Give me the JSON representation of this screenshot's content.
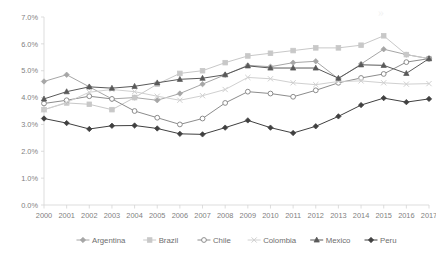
{
  "chart_data": {
    "type": "line",
    "title": "",
    "xlabel": "",
    "ylabel": "",
    "grid": false,
    "legend_position": "bottom",
    "ylim": [
      0,
      7
    ],
    "y_tick_labels": [
      "0.0%",
      "1.0%",
      "2.0%",
      "3.0%",
      "4.0%",
      "5.0%",
      "6.0%",
      "7.0%"
    ],
    "y_tick_values": [
      0,
      1,
      2,
      3,
      4,
      5,
      6,
      7
    ],
    "categories": [
      "2000",
      "2001",
      "2002",
      "2003",
      "2004",
      "2005",
      "2006",
      "2007",
      "2008",
      "2009",
      "2010",
      "2011",
      "2012",
      "2013",
      "2014",
      "2015",
      "2016",
      "2017"
    ],
    "series": [
      {
        "name": "Argentina",
        "color": "#a6a6a6",
        "marker": "diamond",
        "marker_fill": "#a6a6a6",
        "values": [
          4.6,
          4.85,
          4.4,
          3.95,
          4.0,
          3.9,
          4.15,
          4.5,
          4.85,
          5.2,
          5.15,
          5.3,
          5.35,
          4.7,
          5.25,
          5.8,
          5.6,
          5.45
        ]
      },
      {
        "name": "Brazil",
        "color": "#c8c8c8",
        "marker": "square",
        "marker_fill": "#c8c8c8",
        "values": [
          3.55,
          3.8,
          3.75,
          3.55,
          4.0,
          4.5,
          4.9,
          5.0,
          5.3,
          5.55,
          5.65,
          5.75,
          5.85,
          5.85,
          5.95,
          6.3,
          5.6,
          5.45
        ]
      },
      {
        "name": "Chile",
        "color": "#8c8c8c",
        "marker": "circle-open",
        "marker_fill": "#ffffff",
        "values": [
          3.78,
          3.9,
          4.05,
          3.95,
          3.5,
          3.25,
          3.0,
          3.22,
          3.8,
          4.22,
          4.15,
          4.03,
          4.27,
          4.55,
          4.73,
          4.88,
          5.32,
          5.45
        ]
      },
      {
        "name": "Colombia",
        "color": "#d0d0d0",
        "marker": "cross",
        "marker_fill": "#d0d0d0",
        "values": [
          3.55,
          3.82,
          4.2,
          4.3,
          4.22,
          4.05,
          3.9,
          4.07,
          4.3,
          4.75,
          4.7,
          4.55,
          4.48,
          4.6,
          4.62,
          4.55,
          4.5,
          4.52
        ]
      },
      {
        "name": "Mexico",
        "color": "#595959",
        "marker": "triangle",
        "marker_fill": "#595959",
        "values": [
          3.95,
          4.22,
          4.4,
          4.35,
          4.42,
          4.55,
          4.68,
          4.72,
          4.85,
          5.18,
          5.1,
          5.1,
          5.1,
          4.72,
          5.22,
          5.2,
          4.9,
          5.45
        ]
      },
      {
        "name": "Peru",
        "color": "#404040",
        "marker": "diamond",
        "marker_fill": "#404040",
        "values": [
          3.22,
          3.05,
          2.83,
          2.95,
          2.96,
          2.85,
          2.65,
          2.63,
          2.88,
          3.15,
          2.88,
          2.68,
          2.93,
          3.3,
          3.72,
          3.98,
          3.83,
          3.95
        ]
      }
    ]
  },
  "watermark": {
    "text": "»"
  }
}
